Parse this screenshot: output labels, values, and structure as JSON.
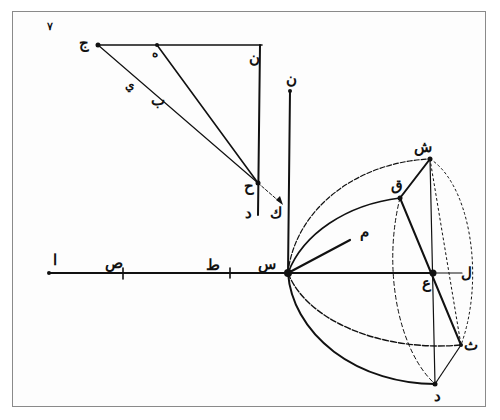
{
  "figure": {
    "number": "٧",
    "ink_color": "#111111",
    "frame_color": "#8a8a8a"
  },
  "labels": {
    "j": "ج",
    "h": "ه",
    "n_top": "ن",
    "y": "ي",
    "b": "ب",
    "h2": "ح",
    "d_left": "د",
    "k": "ك",
    "n_pole": "ن",
    "a": "ا",
    "s_base": "ص",
    "t": "ط",
    "s_center": "س",
    "m": "م",
    "sh": "ش",
    "q": "ق",
    "ain": "ع",
    "l": "ل",
    "th": "ث",
    "d_bottom": "د"
  }
}
